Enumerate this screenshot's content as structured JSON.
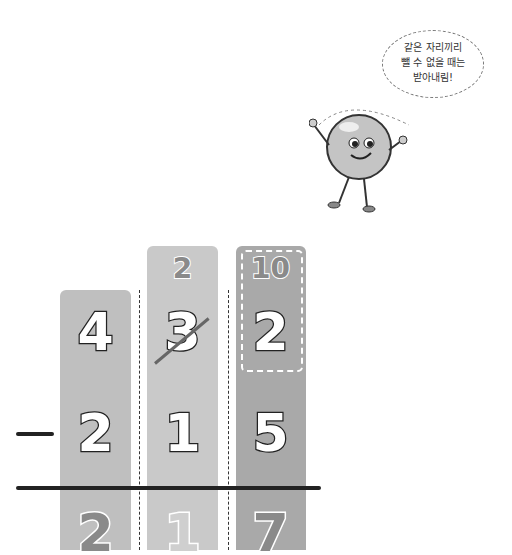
{
  "speech_bubble": {
    "lines": [
      "같은 자리끼리",
      "뺄 수 없을 때는",
      "받아내림!"
    ]
  },
  "problem": {
    "operator": "−",
    "top_row": [
      "4",
      "3",
      "2"
    ],
    "borrow": {
      "tens_new": "2",
      "ones_new": "10",
      "crossed_digit": "3"
    },
    "subtrahend": [
      "2",
      "1",
      "5"
    ],
    "answer": [
      "2",
      "1",
      "7"
    ]
  },
  "colors": {
    "col1": "#bfbfbf",
    "col2": "#c9c9c9",
    "col3": "#a9a9a9",
    "line": "#222222"
  }
}
